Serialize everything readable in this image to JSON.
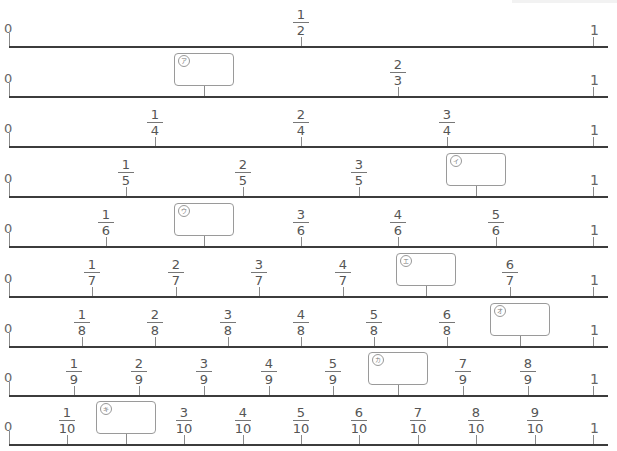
{
  "worksheet": {
    "start_label": "0",
    "end_label": "1",
    "rows": [
      {
        "denominator": 2,
        "labels": [
          {
            "n": 1,
            "num": "1",
            "den": "2"
          }
        ],
        "blanks": []
      },
      {
        "denominator": 3,
        "labels": [
          {
            "n": 2,
            "num": "2",
            "den": "3"
          }
        ],
        "blanks": [
          {
            "n": 1,
            "mark": "ア"
          }
        ]
      },
      {
        "denominator": 4,
        "labels": [
          {
            "n": 1,
            "num": "1",
            "den": "4"
          },
          {
            "n": 2,
            "num": "2",
            "den": "4"
          },
          {
            "n": 3,
            "num": "3",
            "den": "4"
          }
        ],
        "blanks": []
      },
      {
        "denominator": 5,
        "labels": [
          {
            "n": 1,
            "num": "1",
            "den": "5"
          },
          {
            "n": 2,
            "num": "2",
            "den": "5"
          },
          {
            "n": 3,
            "num": "3",
            "den": "5"
          }
        ],
        "blanks": [
          {
            "n": 4,
            "mark": "イ"
          }
        ]
      },
      {
        "denominator": 6,
        "labels": [
          {
            "n": 1,
            "num": "1",
            "den": "6"
          },
          {
            "n": 3,
            "num": "3",
            "den": "6"
          },
          {
            "n": 4,
            "num": "4",
            "den": "6"
          },
          {
            "n": 5,
            "num": "5",
            "den": "6"
          }
        ],
        "blanks": [
          {
            "n": 2,
            "mark": "ウ"
          }
        ]
      },
      {
        "denominator": 7,
        "labels": [
          {
            "n": 1,
            "num": "1",
            "den": "7"
          },
          {
            "n": 2,
            "num": "2",
            "den": "7"
          },
          {
            "n": 3,
            "num": "3",
            "den": "7"
          },
          {
            "n": 4,
            "num": "4",
            "den": "7"
          },
          {
            "n": 6,
            "num": "6",
            "den": "7"
          }
        ],
        "blanks": [
          {
            "n": 5,
            "mark": "エ"
          }
        ]
      },
      {
        "denominator": 8,
        "labels": [
          {
            "n": 1,
            "num": "1",
            "den": "8"
          },
          {
            "n": 2,
            "num": "2",
            "den": "8"
          },
          {
            "n": 3,
            "num": "3",
            "den": "8"
          },
          {
            "n": 4,
            "num": "4",
            "den": "8"
          },
          {
            "n": 5,
            "num": "5",
            "den": "8"
          },
          {
            "n": 6,
            "num": "6",
            "den": "8"
          }
        ],
        "blanks": [
          {
            "n": 7,
            "mark": "オ"
          }
        ]
      },
      {
        "denominator": 9,
        "labels": [
          {
            "n": 1,
            "num": "1",
            "den": "9"
          },
          {
            "n": 2,
            "num": "2",
            "den": "9"
          },
          {
            "n": 3,
            "num": "3",
            "den": "9"
          },
          {
            "n": 4,
            "num": "4",
            "den": "9"
          },
          {
            "n": 5,
            "num": "5",
            "den": "9"
          },
          {
            "n": 7,
            "num": "7",
            "den": "9"
          },
          {
            "n": 8,
            "num": "8",
            "den": "9"
          }
        ],
        "blanks": [
          {
            "n": 6,
            "mark": "カ"
          }
        ]
      },
      {
        "denominator": 10,
        "labels": [
          {
            "n": 1,
            "num": "1",
            "den": "10"
          },
          {
            "n": 3,
            "num": "3",
            "den": "10"
          },
          {
            "n": 4,
            "num": "4",
            "den": "10"
          },
          {
            "n": 5,
            "num": "5",
            "den": "10"
          },
          {
            "n": 6,
            "num": "6",
            "den": "10"
          },
          {
            "n": 7,
            "num": "7",
            "den": "10"
          },
          {
            "n": 8,
            "num": "8",
            "den": "10"
          },
          {
            "n": 9,
            "num": "9",
            "den": "10"
          }
        ],
        "blanks": [
          {
            "n": 2,
            "mark": "キ"
          }
        ]
      }
    ]
  }
}
